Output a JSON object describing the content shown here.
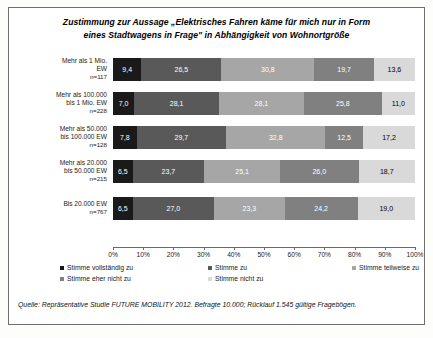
{
  "title": "Zustimmung zur Aussage „Elektrisches Fahren käme für mich nur in Form eines Stadtwagens in Frage\" in Abhängigkeit von Wohnortgröße",
  "title_line1": "Zustimmung zur Aussage „Elektrisches Fahren käme für mich nur in Form",
  "title_line2": "eines Stadtwagens in Frage\" in Abhängigkeit von Wohnortgröße",
  "source": "Quelle: Repräsentative Studie FUTURE MOBILITY 2012. Befragte 10.000; Rücklauf 1.545 gültige Fragebögen.",
  "categories_detail": [
    {
      "line1": "Mehr als 1 Mio.",
      "line2": "EW",
      "n": "n=117"
    },
    {
      "line1": "Mehr als 100.000",
      "line2": "bis 1 Mio. EW",
      "n": "n=228"
    },
    {
      "line1": "Mehr als 50.000",
      "line2": "bis 100.000 EW",
      "n": "n=128"
    },
    {
      "line1": "Mehr als 20.000",
      "line2": "bis 50.000 EW",
      "n": "n=215"
    },
    {
      "line1": "Bis 20.000 EW",
      "line2": "",
      "n": "n=767"
    }
  ],
  "axis_ticks": [
    "0%",
    "10%",
    "20%",
    "30%",
    "40%",
    "50%",
    "60%",
    "70%",
    "80%",
    "90%",
    "100%"
  ],
  "colors": {
    "s0": "#1a1a1a",
    "s1": "#595959",
    "s2": "#a6a6a6",
    "s3": "#808080",
    "s4": "#d9d9d9",
    "frame": "#6f6f6f",
    "text": "#000000"
  },
  "labels": {
    "row0_values": [
      "9,4",
      "26,5",
      "30,8",
      "19,7",
      "13,6"
    ],
    "row1_values": [
      "7,0",
      "28,1",
      "28,1",
      "25,8",
      "11,0"
    ],
    "row2_values": [
      "7,8",
      "29,7",
      "32,8",
      "12,5",
      "17,2"
    ],
    "row3_values": [
      "6,5",
      "23,7",
      "25,1",
      "26,0",
      "18,7"
    ],
    "row4_values": [
      "6,5",
      "27,0",
      "23,3",
      "24,2",
      "19,0"
    ]
  },
  "chart_data": {
    "type": "bar",
    "orientation": "horizontal",
    "stacked": true,
    "normalized_percent": true,
    "title": "Zustimmung zur Aussage „Elektrisches Fahren käme für mich nur in Form eines Stadtwagens in Frage\" in Abhängigkeit von Wohnortgröße",
    "xlabel": "",
    "ylabel": "",
    "xlim": [
      0,
      100
    ],
    "xticks": [
      0,
      10,
      20,
      30,
      40,
      50,
      60,
      70,
      80,
      90,
      100
    ],
    "xticklabels": [
      "0%",
      "10%",
      "20%",
      "30%",
      "40%",
      "50%",
      "60%",
      "70%",
      "80%",
      "90%",
      "100%"
    ],
    "grid": false,
    "legend_position": "bottom",
    "categories": [
      "Mehr als 1 Mio. EW n=117",
      "Mehr als 100.000 bis 1 Mio. EW n=228",
      "Mehr als 50.000 bis 100.000 EW n=128",
      "Mehr als 20.000 bis 50.000 EW n=215",
      "Bis 20.000 EW n=767"
    ],
    "sample_sizes": [
      117,
      228,
      128,
      215,
      767
    ],
    "series": [
      {
        "name": "Stimme vollständig zu",
        "color": "#1a1a1a",
        "values": [
          9.4,
          7.0,
          7.8,
          6.5,
          6.5
        ]
      },
      {
        "name": "Stimme zu",
        "color": "#595959",
        "values": [
          26.5,
          28.1,
          29.7,
          23.7,
          27.0
        ]
      },
      {
        "name": "Stimme teilweise zu",
        "color": "#a6a6a6",
        "values": [
          30.8,
          28.1,
          32.8,
          25.1,
          23.3
        ]
      },
      {
        "name": "Stimme eher nicht zu",
        "color": "#808080",
        "values": [
          19.7,
          25.8,
          12.5,
          26.0,
          24.2
        ]
      },
      {
        "name": "Stimme nicht zu",
        "color": "#d9d9d9",
        "values": [
          13.6,
          11.0,
          17.2,
          18.7,
          19.0
        ]
      }
    ],
    "annotations": [
      "Quelle: Repräsentative Studie FUTURE MOBILITY 2012. Befragte 10.000; Rücklauf 1.545 gültige Fragebögen."
    ]
  }
}
